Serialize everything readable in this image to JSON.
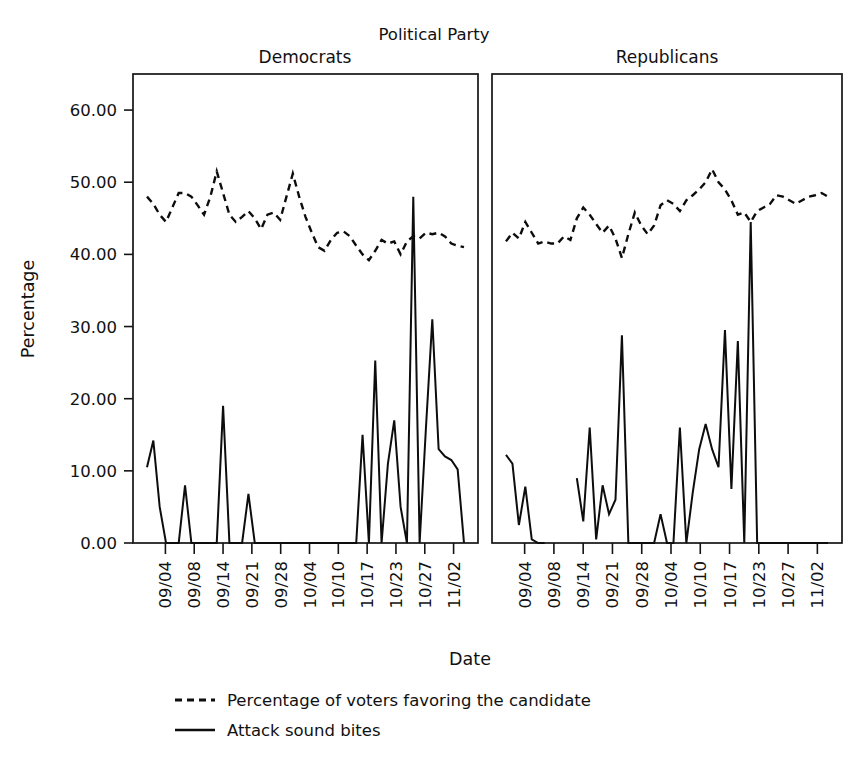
{
  "chart_data": {
    "type": "line",
    "title": "Political Party",
    "xlabel": "Date",
    "ylabel": "Percentage",
    "ylim": [
      0,
      65
    ],
    "grid": false,
    "legend_position": "bottom",
    "y_ticks": [
      "0.00",
      "10.00",
      "20.00",
      "30.00",
      "40.00",
      "50.00",
      "60.00"
    ],
    "y_tick_values": [
      0,
      10,
      20,
      30,
      40,
      50,
      60
    ],
    "x_ticks": [
      "09/04",
      "09/08",
      "09/14",
      "09/21",
      "09/28",
      "10/04",
      "10/10",
      "10/17",
      "10/23",
      "10/27",
      "11/02"
    ],
    "legend": [
      {
        "label": "Percentage of voters favoring the candidate",
        "style": "dashed"
      },
      {
        "label": "Attack sound bites",
        "style": "solid"
      }
    ],
    "panels": [
      {
        "name": "Democrats",
        "series": [
          {
            "name": "Percentage of voters favoring the candidate",
            "style": "dashed",
            "x": [
              0,
              1,
              2,
              3,
              4,
              5,
              6,
              7,
              8,
              9,
              10,
              11,
              12,
              13,
              14,
              15,
              16,
              17,
              18,
              19,
              20,
              21,
              22,
              23,
              24,
              25,
              26,
              27,
              28,
              29,
              30,
              31,
              32,
              33,
              34,
              35,
              36,
              37,
              38,
              39,
              40,
              41,
              42,
              43,
              44,
              45,
              46,
              47,
              48,
              49,
              50
            ],
            "values": [
              48.0,
              47.0,
              45.5,
              44.5,
              46.5,
              48.5,
              48.5,
              48.0,
              46.8,
              45.5,
              48.0,
              51.5,
              48.5,
              45.5,
              44.5,
              45.2,
              46.0,
              45.0,
              43.5,
              45.5,
              45.8,
              44.8,
              48.0,
              51.2,
              48.0,
              45.2,
              43.0,
              41.0,
              40.5,
              42.0,
              43.0,
              43.2,
              42.5,
              41.2,
              40.0,
              39.2,
              40.5,
              42.0,
              41.5,
              41.8,
              40.0,
              41.8,
              42.5,
              42.2,
              43.0,
              42.8,
              43.0,
              42.5,
              41.5,
              41.2,
              41.0
            ]
          },
          {
            "name": "Attack sound bites",
            "style": "solid",
            "x": [
              0,
              1,
              2,
              3,
              4,
              5,
              6,
              7,
              8,
              9,
              10,
              11,
              12,
              13,
              14,
              15,
              16,
              17,
              18,
              19,
              20,
              21,
              22,
              23,
              24,
              25,
              26,
              27,
              28,
              29,
              30,
              31,
              32,
              33,
              34,
              35,
              36,
              37,
              38,
              39,
              40,
              41,
              42,
              43,
              44,
              45,
              46,
              47,
              48,
              49,
              50
            ],
            "values": [
              10.5,
              14.2,
              5.0,
              0.0,
              0.0,
              0.0,
              8.0,
              0.0,
              0.0,
              0.0,
              0.0,
              0.0,
              19.0,
              0.0,
              0.0,
              0.0,
              6.8,
              0.0,
              0.0,
              0.0,
              0.0,
              0.0,
              0.0,
              0.0,
              0.0,
              0.0,
              0.0,
              0.0,
              0.0,
              0.0,
              0.0,
              0.0,
              0.0,
              0.0,
              15.0,
              0.0,
              25.3,
              0.0,
              11.0,
              17.0,
              5.0,
              0.0,
              48.0,
              0.0,
              16.0,
              31.0,
              13.0,
              12.0,
              11.5,
              10.2,
              0.0
            ]
          }
        ]
      },
      {
        "name": "Republicans",
        "series": [
          {
            "name": "Percentage of voters favoring the candidate",
            "style": "dashed",
            "x": [
              0,
              1,
              2,
              3,
              4,
              5,
              6,
              7,
              8,
              9,
              10,
              11,
              12,
              13,
              14,
              15,
              16,
              17,
              18,
              19,
              20,
              21,
              22,
              23,
              24,
              25,
              26,
              27,
              28,
              29,
              30,
              31,
              32,
              33,
              34,
              35,
              36,
              37,
              38,
              39,
              40,
              41,
              42,
              43,
              44,
              45,
              46,
              47,
              48,
              49,
              50
            ],
            "values": [
              41.8,
              43.0,
              42.2,
              44.5,
              43.0,
              41.5,
              41.8,
              41.5,
              41.5,
              42.5,
              42.0,
              45.0,
              46.5,
              45.5,
              44.2,
              43.0,
              44.0,
              42.2,
              39.5,
              42.8,
              45.8,
              44.0,
              42.8,
              44.0,
              46.8,
              47.5,
              47.0,
              46.0,
              47.5,
              48.2,
              49.0,
              50.0,
              51.8,
              50.0,
              49.0,
              47.5,
              45.5,
              45.8,
              44.5,
              46.0,
              46.5,
              47.0,
              48.2,
              48.0,
              47.5,
              47.0,
              47.5,
              48.0,
              48.2,
              48.5,
              48.0
            ]
          },
          {
            "name": "Attack sound bites",
            "style": "solid",
            "x": [
              0,
              1,
              2,
              3,
              4,
              5,
              6,
              7,
              8,
              9,
              10,
              11,
              12,
              13,
              14,
              15,
              16,
              17,
              18,
              19,
              20,
              21,
              22,
              23,
              24,
              25,
              26,
              27,
              28,
              29,
              30,
              31,
              32,
              33,
              34,
              35,
              36,
              37,
              38,
              39,
              40,
              41,
              42,
              43,
              44,
              45,
              46,
              47,
              48,
              49,
              50
            ],
            "values": [
              12.2,
              11.0,
              2.5,
              7.8,
              0.5,
              0.0,
              0.0,
              null,
              null,
              null,
              null,
              9.0,
              3.0,
              16.0,
              0.5,
              8.0,
              4.0,
              6.0,
              28.8,
              0.0,
              0.0,
              0.0,
              0.0,
              0.0,
              4.0,
              0.0,
              0.0,
              16.0,
              0.0,
              7.0,
              13.0,
              16.5,
              13.0,
              10.5,
              29.5,
              7.5,
              28.0,
              0.0,
              44.5,
              0.0,
              0.0,
              0.0,
              0.0,
              0.0,
              0.0,
              0.0,
              0.0,
              0.0,
              0.0,
              0.0,
              0.0
            ]
          }
        ]
      }
    ]
  },
  "layout": {
    "panel_top": 74,
    "panel_bottom": 543,
    "y_axis_max": 65,
    "dem_left": 133,
    "dem_right": 478,
    "rep_left": 492,
    "rep_right": 842,
    "title_y": 40,
    "panel_title_y": 63
  }
}
